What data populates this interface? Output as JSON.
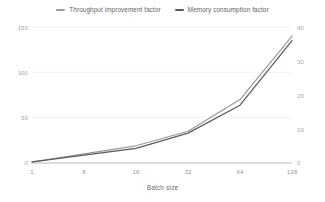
{
  "chart_data": {
    "type": "line",
    "title": "",
    "xlabel": "Batch size",
    "ylabel": "",
    "categories": [
      "1",
      "8",
      "16",
      "32",
      "64",
      "128"
    ],
    "grid": true,
    "legend_position": "top",
    "axes": {
      "left": {
        "ticks": [
          "0",
          "50",
          "100",
          "150"
        ],
        "values": [
          0,
          50,
          100,
          150
        ],
        "ylim": [
          0,
          150
        ]
      },
      "right": {
        "ticks": [
          "0",
          "10",
          "20",
          "30",
          "40"
        ],
        "values": [
          0,
          10,
          20,
          30,
          40
        ],
        "ylim": [
          0,
          40
        ]
      },
      "x": {
        "ticks": [
          "1",
          "8",
          "16",
          "32",
          "64",
          "128"
        ]
      }
    },
    "series": [
      {
        "name": "Throughput improvement factor",
        "axis": "left",
        "color": "#9a9a9a",
        "values": [
          1,
          10,
          19,
          35,
          70,
          140
        ]
      },
      {
        "name": "Memory consumption factor",
        "axis": "right",
        "color": "#5a5a5a",
        "values": [
          0.3,
          2.3,
          4.3,
          8.8,
          17.0,
          36.0
        ]
      }
    ]
  },
  "legend": {
    "items": [
      {
        "label": "Throughput improvement factor",
        "color": "#9a9a9a"
      },
      {
        "label": "Memory consumption factor",
        "color": "#5a5a5a"
      }
    ]
  },
  "colors": {
    "background": "#ffffff",
    "gridline": "#ededed",
    "axis_line": "#b0b0b0",
    "tick_text": "#a8a8a8",
    "title_text": "#6e6e6e",
    "series_throughput": "#9a9a9a",
    "series_memory": "#5a5a5a"
  }
}
